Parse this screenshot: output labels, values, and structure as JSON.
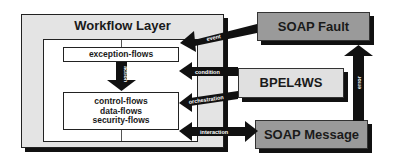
{
  "diagram": {
    "workflow_layer": {
      "title": "Workflow Layer",
      "exception_box": "exception-flows",
      "flows_box": [
        "control-flows",
        "data-flows",
        "security-flows"
      ],
      "inner_arrow_label": "action"
    },
    "external_components": {
      "soap_fault": "SOAP Fault",
      "bpel4ws": "BPEL4WS",
      "soap_message": "SOAP Message"
    },
    "arrows": {
      "event": "event",
      "condition": "condition",
      "orchestration": "orchestration",
      "interaction": "interaction",
      "error": "error"
    },
    "colors": {
      "outer_fill": "#e4e4e4",
      "dark_box_fill": "#9a9a9a",
      "light_box_fill": "#e0e0e0",
      "arrow": "#111111"
    }
  }
}
